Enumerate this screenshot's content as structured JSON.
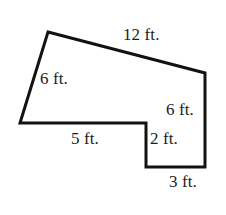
{
  "figure": {
    "type": "geometry-polygon-diagram",
    "shape_name": "L-shaped hexagon (rectilinear polygon with slanted top and left sides)",
    "stroke_color": "#121212",
    "fill_color": "#ffffff",
    "background_color": "#ffffff",
    "stroke_width": 3,
    "item_marker": ".",
    "vertices": [
      {
        "name": "top-apex",
        "x": 48,
        "y": 32
      },
      {
        "name": "top-right",
        "x": 205,
        "y": 73
      },
      {
        "name": "bottom-right",
        "x": 205,
        "y": 167
      },
      {
        "name": "notch-bottom-left",
        "x": 146,
        "y": 167
      },
      {
        "name": "notch-inner-corner",
        "x": 146,
        "y": 123
      },
      {
        "name": "bottom-left",
        "x": 20,
        "y": 123
      }
    ],
    "labels": {
      "top": "12 ft.",
      "left": "6 ft.",
      "right": "6 ft.",
      "bottom": "5 ft.",
      "notch": "2 ft.",
      "base": "3 ft."
    },
    "sides": [
      {
        "label": "12 ft.",
        "value": 12,
        "unit": "ft.",
        "edge": "top-apex to top-right"
      },
      {
        "label": "6 ft.",
        "value": 6,
        "unit": "ft.",
        "edge": "bottom-left to top-apex"
      },
      {
        "label": "6 ft.",
        "value": 6,
        "unit": "ft.",
        "edge": "top-right to bottom-right"
      },
      {
        "label": "5 ft.",
        "value": 5,
        "unit": "ft.",
        "edge": "bottom-left to notch-inner-corner"
      },
      {
        "label": "2 ft.",
        "value": 2,
        "unit": "ft.",
        "edge": "notch-inner-corner to notch-bottom-left"
      },
      {
        "label": "3 ft.",
        "value": 3,
        "unit": "ft.",
        "edge": "notch-bottom-left to bottom-right"
      }
    ]
  }
}
